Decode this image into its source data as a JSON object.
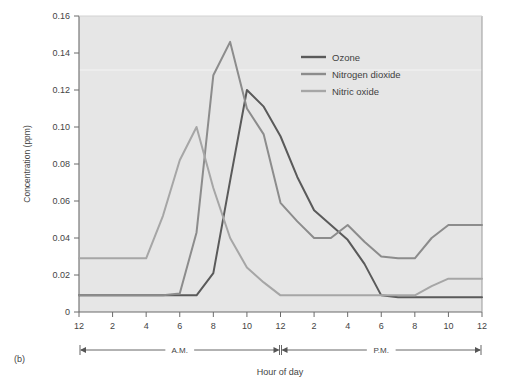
{
  "caption": "(b)",
  "chart_data": {
    "type": "line",
    "title": "",
    "xlabel": "Hour of day",
    "ylabel": "Concentration (ppm)",
    "xlim": [
      0,
      24
    ],
    "ylim": [
      0,
      0.16
    ],
    "yticks": [
      "0",
      "0.02",
      "0.04",
      "0.06",
      "0.08",
      "0.10",
      "0.12",
      "0.14",
      "0.16"
    ],
    "ytick_values": [
      0,
      0.02,
      0.04,
      0.06,
      0.08,
      0.1,
      0.12,
      0.14,
      0.16
    ],
    "xticks": [
      "12",
      "2",
      "4",
      "6",
      "8",
      "10",
      "12",
      "2",
      "4",
      "6",
      "8",
      "10",
      "12"
    ],
    "xtick_values": [
      0,
      2,
      4,
      6,
      8,
      10,
      12,
      14,
      16,
      18,
      20,
      22,
      24
    ],
    "grid": false,
    "legend_position": "top-right",
    "axis_spans": [
      {
        "label": "A.M.",
        "from": 0,
        "to": 12
      },
      {
        "label": "P.M.",
        "to": 24,
        "from": 12
      }
    ],
    "series": [
      {
        "name": "Ozone",
        "color": "#5a5a5a",
        "x": [
          0,
          2,
          4,
          6,
          7,
          8,
          9,
          10,
          11,
          12,
          13,
          14,
          15,
          16,
          17,
          18,
          19,
          20,
          22,
          24
        ],
        "values": [
          0.009,
          0.009,
          0.009,
          0.009,
          0.009,
          0.021,
          0.071,
          0.12,
          0.111,
          0.095,
          0.073,
          0.055,
          0.047,
          0.039,
          0.026,
          0.009,
          0.008,
          0.008,
          0.008,
          0.008
        ]
      },
      {
        "name": "Nitrogen dioxide",
        "color": "#8c8c8c",
        "x": [
          0,
          2,
          4,
          5,
          6,
          7,
          8,
          9,
          10,
          11,
          12,
          13,
          14,
          15,
          16,
          17,
          18,
          19,
          20,
          21,
          22,
          24
        ],
        "values": [
          0.009,
          0.009,
          0.009,
          0.009,
          0.01,
          0.043,
          0.128,
          0.146,
          0.11,
          0.096,
          0.059,
          0.049,
          0.04,
          0.04,
          0.047,
          0.038,
          0.03,
          0.029,
          0.029,
          0.04,
          0.047,
          0.047
        ]
      },
      {
        "name": "Nitric oxide",
        "color": "#a6a6a6",
        "x": [
          0,
          2,
          4,
          5,
          6,
          7,
          8,
          9,
          10,
          11,
          12,
          14,
          16,
          18,
          20,
          21,
          22,
          24
        ],
        "values": [
          0.029,
          0.029,
          0.029,
          0.052,
          0.082,
          0.1,
          0.067,
          0.04,
          0.024,
          0.016,
          0.009,
          0.009,
          0.009,
          0.009,
          0.009,
          0.014,
          0.018,
          0.018
        ]
      }
    ]
  },
  "legend": {
    "items": [
      {
        "label": "Ozone",
        "color": "#5a5a5a"
      },
      {
        "label": "Nitrogen dioxide",
        "color": "#8c8c8c"
      },
      {
        "label": "Nitric oxide",
        "color": "#a6a6a6"
      }
    ]
  },
  "colors": {
    "plot_background": "#e6e6e6",
    "page_background": "#ffffff",
    "axis": "#5a5a5a",
    "text": "#444444"
  }
}
